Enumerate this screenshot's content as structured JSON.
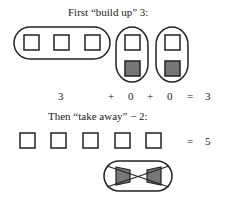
{
  "build_up": {
    "title": "First “build up” 3:",
    "terms": [
      "3",
      "+",
      "0",
      "+",
      "0",
      "=",
      "3"
    ]
  },
  "take_away": {
    "title": "Then “take away” − 2:",
    "equals": "=",
    "result": "5"
  },
  "colors": {
    "stroke": "#222222",
    "negative_fill": "#777777",
    "positive_fill": "#ffffff"
  }
}
